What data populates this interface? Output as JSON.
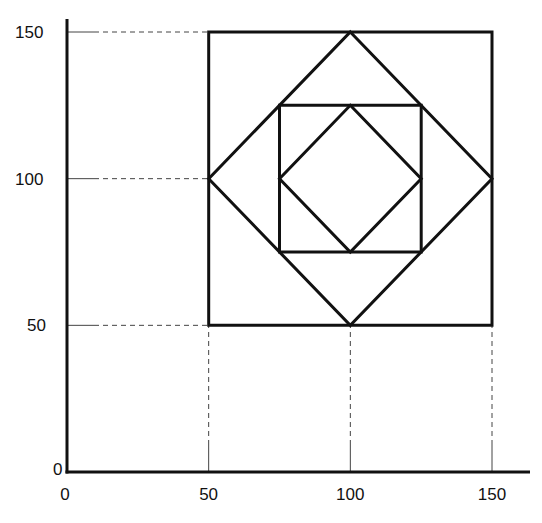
{
  "chart_data": {
    "type": "diagram",
    "title": "",
    "xlabel": "",
    "ylabel": "",
    "xlim": [
      0,
      150
    ],
    "ylim": [
      0,
      150
    ],
    "x_ticks": [
      0,
      50,
      100,
      150
    ],
    "y_ticks": [
      0,
      50,
      100,
      150
    ],
    "grid": false,
    "shapes": [
      {
        "name": "outer-square",
        "points": [
          [
            50,
            50
          ],
          [
            150,
            50
          ],
          [
            150,
            150
          ],
          [
            50,
            150
          ]
        ]
      },
      {
        "name": "outer-diamond",
        "points": [
          [
            100,
            150
          ],
          [
            150,
            100
          ],
          [
            100,
            50
          ],
          [
            50,
            100
          ]
        ]
      },
      {
        "name": "inner-square",
        "points": [
          [
            75,
            75
          ],
          [
            125,
            75
          ],
          [
            125,
            125
          ],
          [
            75,
            125
          ]
        ]
      },
      {
        "name": "inner-diamond",
        "points": [
          [
            100,
            125
          ],
          [
            125,
            100
          ],
          [
            100,
            75
          ],
          [
            75,
            100
          ]
        ]
      }
    ],
    "guide_lines": "dashed lines from axes to x=50,100,150 and y=50,100,150"
  },
  "axes": {
    "x_labels": [
      "0",
      "50",
      "100",
      "150"
    ],
    "y_labels": [
      "0",
      "50",
      "100",
      "150"
    ]
  },
  "colors": {
    "stroke": "#111111",
    "guide": "#444444",
    "background": "#ffffff"
  }
}
